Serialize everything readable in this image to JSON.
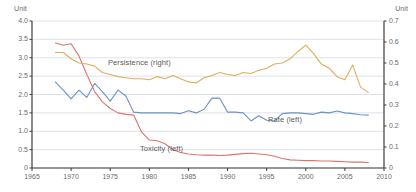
{
  "chart_data": {
    "type": "line",
    "title": "",
    "xlabel": "",
    "ylabel_left": "Unit",
    "ylabel_right": "Unit",
    "grid": true,
    "legend_position": "inline-annotations",
    "xlim": [
      1965,
      2010
    ],
    "xticks": [
      "1965",
      "1970",
      "1975",
      "1980",
      "1985",
      "1990",
      "1995",
      "2000",
      "2005",
      "2010"
    ],
    "ylim_left": [
      0,
      4.0
    ],
    "yticks_left": [
      "4.0",
      "3.5",
      "3.0",
      "2.5",
      "2.0",
      "1.5",
      "1.0",
      "0.5",
      "0"
    ],
    "ylim_right": [
      0,
      0.7
    ],
    "yticks_right": [
      "0.7",
      "0.6",
      "0.5",
      "0.4",
      "0.3",
      "0.2",
      "0.1",
      "0"
    ],
    "x": [
      1968,
      1969,
      1970,
      1971,
      1972,
      1973,
      1974,
      1975,
      1976,
      1977,
      1978,
      1979,
      1980,
      1981,
      1982,
      1983,
      1984,
      1985,
      1986,
      1987,
      1988,
      1989,
      1990,
      1991,
      1992,
      1993,
      1994,
      1995,
      1996,
      1997,
      1998,
      1999,
      2000,
      2001,
      2002,
      2003,
      2004,
      2005,
      2006,
      2007,
      2008
    ],
    "series": [
      {
        "name": "Toxicity (left)",
        "axis": "left",
        "color": "#d9756b",
        "label": "Toxicity (left)",
        "values": [
          3.4,
          3.34,
          3.38,
          3.05,
          2.55,
          2.08,
          1.8,
          1.62,
          1.5,
          1.46,
          1.44,
          0.98,
          0.76,
          0.74,
          0.66,
          0.5,
          0.42,
          0.38,
          0.36,
          0.35,
          0.35,
          0.34,
          0.35,
          0.37,
          0.39,
          0.4,
          0.38,
          0.36,
          0.32,
          0.26,
          0.22,
          0.21,
          0.2,
          0.2,
          0.19,
          0.19,
          0.18,
          0.17,
          0.16,
          0.16,
          0.15
        ]
      },
      {
        "name": "Rate (left)",
        "axis": "left",
        "color": "#6e93c3",
        "label": "Rate (left)",
        "values": [
          2.34,
          2.12,
          1.88,
          2.12,
          1.92,
          2.3,
          2.08,
          1.82,
          2.12,
          1.96,
          1.52,
          1.5,
          1.5,
          1.5,
          1.5,
          1.5,
          1.48,
          1.56,
          1.5,
          1.6,
          1.9,
          1.9,
          1.52,
          1.52,
          1.5,
          1.28,
          1.42,
          1.3,
          1.28,
          1.48,
          1.5,
          1.5,
          1.48,
          1.46,
          1.52,
          1.5,
          1.55,
          1.5,
          1.48,
          1.45,
          1.44
        ]
      },
      {
        "name": "Persistence (right)",
        "axis": "right",
        "color": "#dfae5e",
        "label": "Persistence (right)",
        "values": [
          0.55,
          0.55,
          0.52,
          0.5,
          0.495,
          0.485,
          0.455,
          0.445,
          0.435,
          0.43,
          0.425,
          0.425,
          0.42,
          0.435,
          0.425,
          0.44,
          0.425,
          0.41,
          0.405,
          0.43,
          0.44,
          0.455,
          0.445,
          0.44,
          0.455,
          0.45,
          0.465,
          0.475,
          0.495,
          0.5,
          0.52,
          0.555,
          0.585,
          0.545,
          0.495,
          0.475,
          0.435,
          0.42,
          0.49,
          0.385,
          0.36
        ]
      }
    ],
    "annotations": [
      {
        "text": "Persistence (right)",
        "x_px": 108,
        "y_px": 58
      },
      {
        "text": "Rate (left)",
        "x_px": 268,
        "y_px": 115
      },
      {
        "text": "Toxicity (left)",
        "x_px": 140,
        "y_px": 144
      }
    ]
  }
}
